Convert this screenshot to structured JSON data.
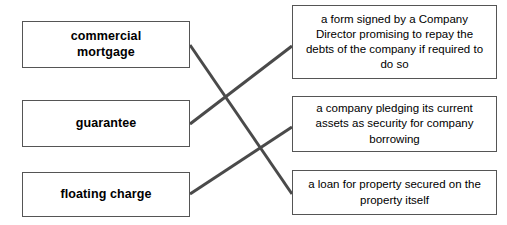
{
  "page": {
    "background_color": "#ffffff",
    "box_border_color": "#555555",
    "line_color": "#4a4a4a",
    "text_color": "#000000"
  },
  "terms": [
    {
      "id": "commercial-mortgage",
      "label": "commercial\nmortgage",
      "x": 22,
      "y": 21,
      "width": 168,
      "height": 47
    },
    {
      "id": "guarantee",
      "label": "guarantee",
      "x": 22,
      "y": 100,
      "width": 168,
      "height": 47
    },
    {
      "id": "floating-charge",
      "label": "floating charge",
      "x": 22,
      "y": 172,
      "width": 168,
      "height": 45
    }
  ],
  "definitions": [
    {
      "id": "guarantee-definition",
      "label": "a form signed by a Company Director promising to repay the debts of the company if required to do so",
      "x": 292,
      "y": 5,
      "width": 205,
      "height": 74
    },
    {
      "id": "floating-charge-definition",
      "label": "a company pledging its current assets as security for company borrowing",
      "x": 292,
      "y": 96,
      "width": 205,
      "height": 56
    },
    {
      "id": "commercial-mortgage-definition",
      "label": "a loan for property secured on the property itself",
      "x": 292,
      "y": 170,
      "width": 205,
      "height": 45
    }
  ],
  "connections": [
    {
      "id": "commercial-mortgage-to-loan",
      "from": "commercial-mortgage",
      "to": "commercial-mortgage-definition",
      "x1": 190,
      "y1": 45,
      "x2": 292,
      "y2": 194
    },
    {
      "id": "guarantee-to-form-signed",
      "from": "guarantee",
      "to": "guarantee-definition",
      "x1": 190,
      "y1": 124,
      "x2": 292,
      "y2": 46
    },
    {
      "id": "floating-charge-to-pledging",
      "from": "floating-charge",
      "to": "floating-charge-definition",
      "x1": 190,
      "y1": 194,
      "x2": 292,
      "y2": 127
    }
  ]
}
